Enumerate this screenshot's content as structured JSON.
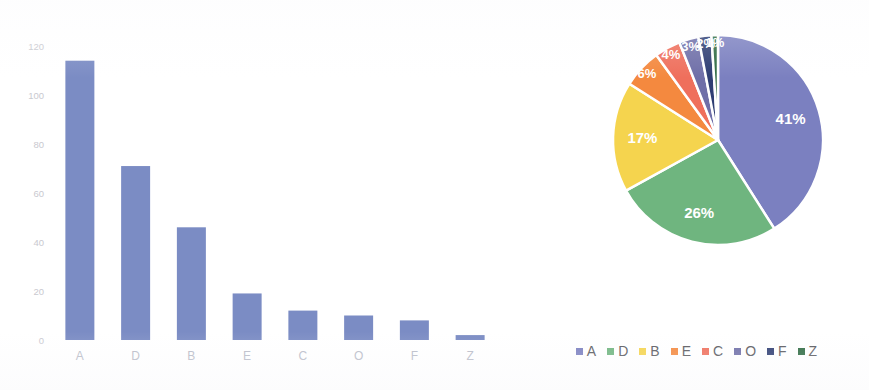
{
  "chart_data": [
    {
      "type": "bar",
      "title": "",
      "xlabel": "",
      "ylabel": "",
      "categories": [
        "A",
        "D",
        "B",
        "E",
        "C",
        "O",
        "F",
        "Z"
      ],
      "values": [
        114,
        71,
        46,
        19,
        12,
        10,
        8,
        2
      ],
      "ylim": [
        0,
        120
      ],
      "yticks": [
        0,
        20,
        40,
        60,
        80,
        100,
        120
      ],
      "ytick_labels": [
        "0",
        "20",
        "40",
        "60",
        "80",
        "100",
        "120"
      ],
      "grid": false,
      "legend": "none",
      "bar_color": "#7b8cc4"
    },
    {
      "type": "pie",
      "title": "",
      "categories": [
        "A",
        "D",
        "B",
        "E",
        "C",
        "O",
        "F",
        "Z"
      ],
      "values": [
        41,
        26,
        17,
        6,
        4,
        3,
        2,
        1
      ],
      "labels": [
        "41%",
        "26%",
        "17%",
        "6%",
        "4%",
        "3%",
        "2%",
        "1%"
      ],
      "colors": [
        "#7b80c0",
        "#6fb57f",
        "#f5d44e",
        "#f4893f",
        "#ef6f5c",
        "#6f6fa8",
        "#2f3e73",
        "#2f6b43"
      ],
      "legend": "bottom",
      "legend_entries": [
        {
          "label": "A",
          "color": "#7b80c0"
        },
        {
          "label": "D",
          "color": "#6fb57f"
        },
        {
          "label": "B",
          "color": "#f5d44e"
        },
        {
          "label": "E",
          "color": "#f4893f"
        },
        {
          "label": "C",
          "color": "#ef6f5c"
        },
        {
          "label": "O",
          "color": "#6f6fa8"
        },
        {
          "label": "F",
          "color": "#2f3e73"
        },
        {
          "label": "Z",
          "color": "#2f6b43"
        }
      ]
    }
  ],
  "bar_chart": {
    "ytick_labels": [
      "120",
      "100",
      "80",
      "60",
      "40",
      "20",
      "0"
    ],
    "bars": [
      {
        "label": "A",
        "value": 114
      },
      {
        "label": "D",
        "value": 71
      },
      {
        "label": "B",
        "value": 46
      },
      {
        "label": "E",
        "value": 19
      },
      {
        "label": "C",
        "value": 12
      },
      {
        "label": "O",
        "value": 10
      },
      {
        "label": "F",
        "value": 8
      },
      {
        "label": "Z",
        "value": 2
      }
    ]
  },
  "pie_chart": {
    "slice_labels": [
      "41%",
      "26%",
      "17%",
      "6%",
      "4%",
      "3%",
      "2%",
      "1%"
    ],
    "legend_labels": [
      "A",
      "D",
      "B",
      "E",
      "C",
      "O",
      "F",
      "Z"
    ]
  },
  "colors": {
    "bar_fill": "#7b8cc4",
    "slice_a": "#7b80c0",
    "slice_d": "#6fb57f",
    "slice_b": "#f5d44e",
    "slice_e": "#f4893f",
    "slice_c": "#ef6f5c",
    "slice_o": "#6f6fa8",
    "slice_f": "#2f3e73",
    "slice_z": "#2f6b43",
    "tick_text": "#c9c9cf",
    "category_text": "#b9bcc8",
    "legend_text": "#5a5a60",
    "background": "#ffffff"
  }
}
